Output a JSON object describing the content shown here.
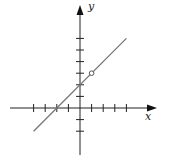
{
  "chart_data": {
    "type": "line",
    "title": "",
    "xlabel": "x",
    "ylabel": "y",
    "xlim": [
      -6.5,
      7
    ],
    "ylim": [
      -4.5,
      7
    ],
    "grid": false,
    "ticks": {
      "x": [
        -4,
        -3,
        -2,
        -1,
        1,
        2,
        3,
        4
      ],
      "y": [
        -2,
        -1,
        1,
        2,
        3,
        4,
        5,
        6
      ]
    },
    "series": [
      {
        "name": "y = x + 2",
        "x": [
          -4,
          4
        ],
        "y": [
          -2,
          6
        ],
        "color": "#777777"
      }
    ],
    "annotations": [
      {
        "type": "open-circle",
        "x": 1,
        "y": 3
      }
    ]
  },
  "labels": {
    "x": "x",
    "y": "y"
  }
}
